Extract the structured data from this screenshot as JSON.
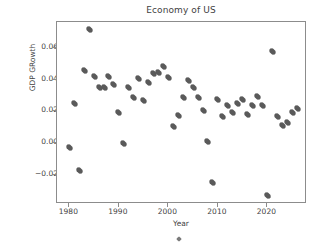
{
  "chart_data": {
    "type": "scatter",
    "title": "Economy of US",
    "xlabel": "Year",
    "ylabel": "GDP GRowth",
    "grid": false,
    "legend": null,
    "xlim": [
      1977.5,
      2028.0
    ],
    "ylim": [
      -0.0385,
      0.0765
    ],
    "xticks": [
      1980,
      1990,
      2000,
      2010,
      2020
    ],
    "xtick_labels": [
      "1980",
      "1990",
      "2000",
      "2010",
      "2020"
    ],
    "yticks": [
      0.06,
      0.04,
      0.02,
      0.0,
      -0.02
    ],
    "ytick_labels": [
      "0.06",
      "0.04",
      "0.02",
      "0.00",
      "−0.02"
    ],
    "marker": "plus-filled",
    "marker_color": "#5a5a5a",
    "x": [
      1980,
      1981,
      1982,
      1983,
      1984,
      1985,
      1986,
      1987,
      1988,
      1989,
      1990,
      1991,
      1992,
      1993,
      1994,
      1995,
      1996,
      1997,
      1998,
      1999,
      2000,
      2001,
      2002,
      2003,
      2004,
      2005,
      2006,
      2007,
      2008,
      2009,
      2010,
      2011,
      2012,
      2013,
      2014,
      2015,
      2016,
      2017,
      2018,
      2019,
      2020,
      2021,
      2022,
      2023,
      2024,
      2025,
      2026
    ],
    "y": [
      -0.003,
      0.025,
      -0.0175,
      0.046,
      0.0715,
      0.042,
      0.035,
      0.0352,
      0.042,
      0.0373,
      0.0195,
      -0.0005,
      0.0352,
      0.0285,
      0.0405,
      0.0272,
      0.038,
      0.0442,
      0.0448,
      0.0482,
      0.0412,
      0.0105,
      0.0177,
      0.0288,
      0.0393,
      0.0352,
      0.0288,
      0.0207,
      0.0013,
      -0.0252,
      0.0275,
      0.017,
      0.0238,
      0.0192,
      0.0248,
      0.0277,
      0.0182,
      0.0238,
      0.0297,
      0.0238,
      -0.0332,
      0.0578,
      0.017,
      0.0108,
      0.0127,
      0.0192,
      0.0219
    ],
    "series_name": "GDP Growth"
  },
  "figure": {
    "background_color": "#ffffff",
    "axes_edge_color": "#8c8c8c",
    "text_color": "#3f3f3f"
  }
}
